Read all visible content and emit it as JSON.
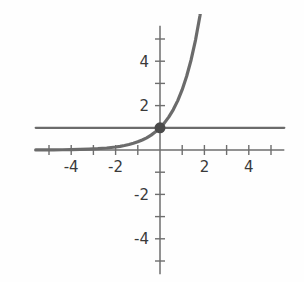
{
  "chart_data": {
    "type": "line",
    "title": "",
    "subtitle": "",
    "xlabel": "",
    "ylabel": "",
    "xlim": [
      -5.6,
      5.6
    ],
    "ylim": [
      -5.6,
      5.6
    ],
    "grid": false,
    "legend": null,
    "legend_position": "none",
    "background_color": "#fefefe",
    "axis_color": "#6e6e6e",
    "curve_color": "#6b6b6b",
    "asymptote_color": "#6b6b6b",
    "point_color": "#4a4a4a",
    "x_ticks": [
      -5,
      -4,
      -3,
      -2,
      -1,
      1,
      2,
      3,
      4,
      5
    ],
    "y_ticks": [
      -5,
      -4,
      -3,
      -2,
      -1,
      1,
      2,
      3,
      4,
      5
    ],
    "x_tick_labels": [
      {
        "value": -4,
        "text": "-4"
      },
      {
        "value": -2,
        "text": "-2"
      },
      {
        "value": 2,
        "text": "2"
      },
      {
        "value": 4,
        "text": "4"
      }
    ],
    "y_tick_labels": [
      {
        "value": 4,
        "text": "4"
      },
      {
        "value": 2,
        "text": "2"
      },
      {
        "value": -2,
        "text": "-2"
      },
      {
        "value": -4,
        "text": "-4"
      }
    ],
    "series": [
      {
        "name": "exponential-curve",
        "type": "line",
        "color": "#6b6b6b",
        "line_width": 3.2,
        "x": [
          -5.6,
          -5.2,
          -4.8,
          -4.4,
          -4.0,
          -3.6,
          -3.2,
          -2.8,
          -2.4,
          -2.0,
          -1.8,
          -1.6,
          -1.4,
          -1.2,
          -1.0,
          -0.8,
          -0.6,
          -0.4,
          -0.2,
          0.0,
          0.2,
          0.4,
          0.6,
          0.8,
          1.0,
          1.2,
          1.4,
          1.6,
          1.8,
          2.0
        ],
        "y": [
          0.0037,
          0.0055,
          0.0082,
          0.0123,
          0.0183,
          0.0273,
          0.0408,
          0.0608,
          0.0907,
          0.1353,
          0.1653,
          0.2019,
          0.2466,
          0.3012,
          0.3679,
          0.4493,
          0.5488,
          0.6703,
          0.8187,
          1.0,
          1.2214,
          1.4918,
          1.8221,
          2.2255,
          2.7183,
          3.3201,
          4.0552,
          4.953,
          6.0496,
          7.3891
        ]
      },
      {
        "name": "horizontal-asymptote-line",
        "type": "line",
        "color": "#6b6b6b",
        "line_width": 2.2,
        "x": [
          -5.6,
          5.6
        ],
        "y": [
          1.0,
          1.0
        ]
      }
    ],
    "points": [
      {
        "name": "y-intercept",
        "x": 0,
        "y": 1,
        "color": "#4a4a4a",
        "radius": 5.5
      }
    ],
    "annotations": []
  }
}
